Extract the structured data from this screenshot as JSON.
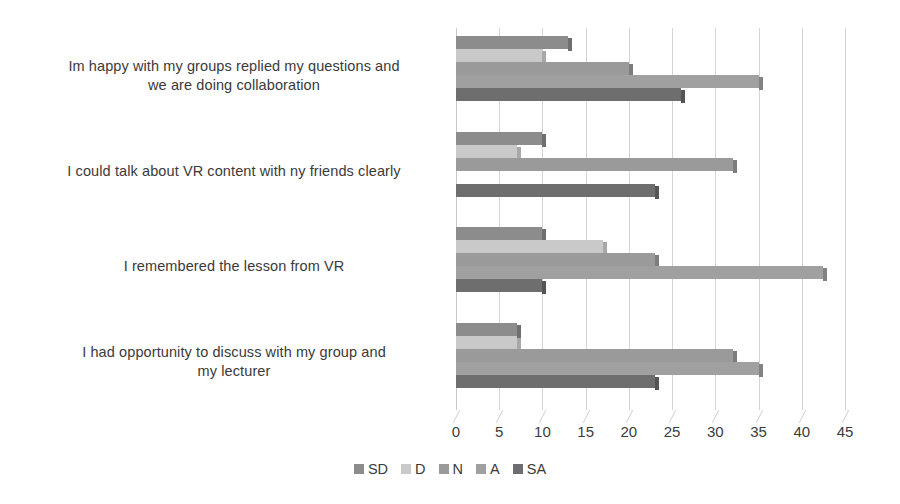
{
  "chart_data": {
    "type": "bar",
    "orientation": "horizontal",
    "grouped": true,
    "title": "",
    "xlabel": "",
    "ylabel": "",
    "xlim": [
      0,
      45
    ],
    "xticks": [
      0,
      5,
      10,
      15,
      20,
      25,
      30,
      35,
      40,
      45
    ],
    "xtick_labels": [
      "0",
      "5",
      "10",
      "15",
      "20",
      "25",
      "30",
      "35",
      "40",
      "45"
    ],
    "grid": true,
    "grid_axis": "x",
    "legend_position": "bottom",
    "categories": [
      "Im happy with my groups replied my questions and we are doing collaboration",
      "I could talk about VR content with ny friends clearly",
      "I remembered the lesson from VR",
      "I had opportunity to discuss with my group and my lecturer"
    ],
    "category_lines": [
      [
        "Im happy with my groups replied my questions and",
        "we are doing collaboration"
      ],
      [
        "I could talk about VR content with ny friends clearly"
      ],
      [
        "I remembered the lesson from VR"
      ],
      [
        "I had opportunity to discuss with my group and",
        "my lecturer"
      ]
    ],
    "series": [
      {
        "name": "SD",
        "color": "#8c8c8c",
        "cap_color": "#6f6f6f",
        "values": [
          13,
          10,
          10,
          7
        ]
      },
      {
        "name": "D",
        "color": "#c9c9c9",
        "cap_color": "#a8a8a8",
        "values": [
          10,
          7,
          17,
          7
        ]
      },
      {
        "name": "N",
        "color": "#9a9a9a",
        "cap_color": "#7d7d7d",
        "values": [
          20,
          32,
          23,
          32
        ]
      },
      {
        "name": "A",
        "color": "#a0a0a0",
        "cap_color": "#828282",
        "values": [
          35,
          0,
          42.5,
          35
        ]
      },
      {
        "name": "SA",
        "color": "#6e6e6e",
        "cap_color": "#555555",
        "values": [
          26,
          23,
          10,
          23
        ]
      }
    ]
  },
  "legend": {
    "items": [
      {
        "label": "SD",
        "color": "#8c8c8c"
      },
      {
        "label": "D",
        "color": "#c9c9c9"
      },
      {
        "label": "N",
        "color": "#9a9a9a"
      },
      {
        "label": "A",
        "color": "#a0a0a0"
      },
      {
        "label": "SA",
        "color": "#6e6e6e"
      }
    ]
  }
}
